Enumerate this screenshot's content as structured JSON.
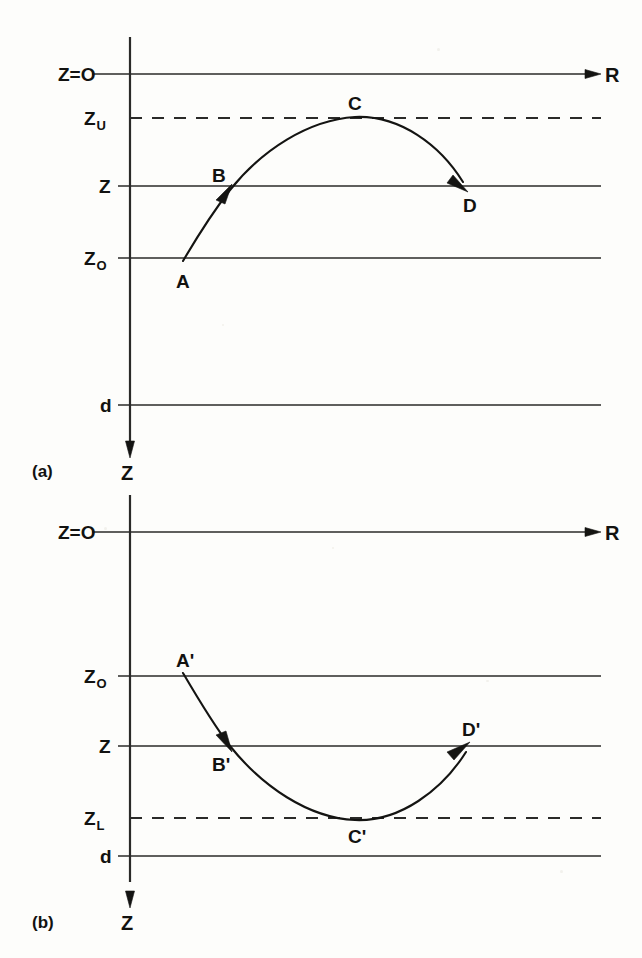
{
  "figure": {
    "background_color": "#fdfdfb",
    "ink_color": "#141412",
    "panels": [
      {
        "id": "a",
        "panel_label": "(a)",
        "description": "Upward-refracting ray path A to D turning at upper level Z_U",
        "depth_axis_label": "Z",
        "range_axis_label": "R",
        "levels": [
          {
            "name": "surface",
            "label": "Z=O",
            "sub": "",
            "style": "solid"
          },
          {
            "name": "upper-turn",
            "label": "Z",
            "sub": "U",
            "style": "dashed"
          },
          {
            "name": "receiver",
            "label": "Z",
            "sub": "",
            "style": "solid"
          },
          {
            "name": "source",
            "label": "Z",
            "sub": "O",
            "style": "solid"
          },
          {
            "name": "bottom",
            "label": "d",
            "sub": "",
            "style": "solid"
          }
        ],
        "points": [
          {
            "label": "A",
            "on_level": "source"
          },
          {
            "label": "B",
            "on_level": "receiver"
          },
          {
            "label": "C",
            "on_level": "upper-turn"
          },
          {
            "label": "D",
            "on_level": "receiver"
          }
        ]
      },
      {
        "id": "b",
        "panel_label": "(b)",
        "description": "Downward-refracting ray path A-prime to D-prime turning at lower level Z_L",
        "depth_axis_label": "Z",
        "range_axis_label": "R",
        "levels": [
          {
            "name": "surface",
            "label": "Z=O",
            "sub": "",
            "style": "solid"
          },
          {
            "name": "source",
            "label": "Z",
            "sub": "O",
            "style": "solid"
          },
          {
            "name": "receiver",
            "label": "Z",
            "sub": "",
            "style": "solid"
          },
          {
            "name": "lower-turn",
            "label": "Z",
            "sub": "L",
            "style": "dashed"
          },
          {
            "name": "bottom",
            "label": "d",
            "sub": "",
            "style": "solid"
          }
        ],
        "points": [
          {
            "label": "A'",
            "on_level": "source"
          },
          {
            "label": "B'",
            "on_level": "receiver"
          },
          {
            "label": "C'",
            "on_level": "lower-turn"
          },
          {
            "label": "D'",
            "on_level": "receiver"
          }
        ]
      }
    ]
  },
  "labels": {
    "panel_a": "(a)",
    "panel_b": "(b)",
    "z_equals_zero": "Z=O",
    "z_upper_main": "Z",
    "z_upper_sub": "U",
    "z_lower_main": "Z",
    "z_lower_sub": "L",
    "z_plain": "Z",
    "z_source_main": "Z",
    "z_source_sub": "O",
    "depth_d": "d",
    "depth_axis": "Z",
    "range_axis": "R",
    "pt_a": "A",
    "pt_b": "B",
    "pt_c": "C",
    "pt_d": "D",
    "pt_a_prime": "A'",
    "pt_b_prime": "B'",
    "pt_c_prime": "C'",
    "pt_d_prime": "D'"
  }
}
